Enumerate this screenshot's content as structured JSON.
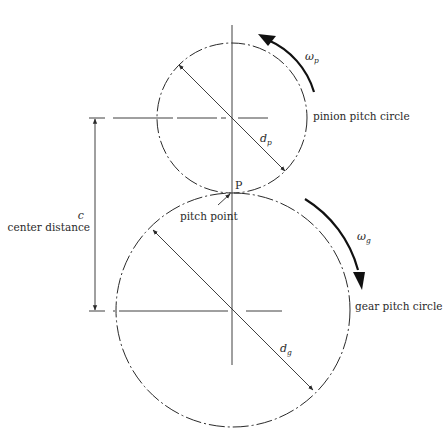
{
  "diagram": {
    "colors": {
      "line": "#2a2a2a",
      "background": "#ffffff"
    },
    "pinion": {
      "label": "pinion pitch circle",
      "diameter_symbol": "d",
      "diameter_sub": "p",
      "omega_symbol": "ω",
      "omega_sub": "p",
      "rotation": "counterclockwise"
    },
    "gear": {
      "label": "gear pitch circle",
      "diameter_symbol": "d",
      "diameter_sub": "g",
      "omega_symbol": "ω",
      "omega_sub": "g",
      "rotation": "clockwise"
    },
    "pitch_point": {
      "marker": "P",
      "label": "pitch point"
    },
    "center_distance": {
      "symbol": "c",
      "label": "center distance"
    }
  }
}
